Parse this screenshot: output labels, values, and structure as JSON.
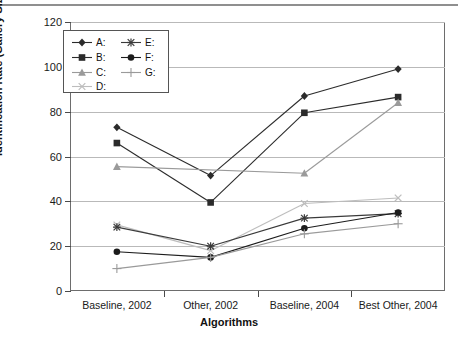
{
  "chart_data": {
    "type": "line",
    "title": "",
    "xlabel": "Algorithms",
    "ylabel": "Identification Rate (Gallery Size = 71)",
    "categories": [
      "Baseline, 2002",
      "Other, 2002",
      "Baseline, 2004",
      "Best Other, 2004"
    ],
    "ylim": [
      0,
      120
    ],
    "yticks": [
      0,
      20,
      40,
      60,
      80,
      100,
      120
    ],
    "grid": true,
    "legend_position": "upper-left-inside",
    "series": [
      {
        "name": "A:",
        "marker": "diamond",
        "color": "#2b2b2b",
        "values": [
          73,
          51.5,
          87,
          99
        ]
      },
      {
        "name": "B:",
        "marker": "square",
        "color": "#2b2b2b",
        "values": [
          66,
          39.5,
          79.5,
          86.5
        ]
      },
      {
        "name": "C:",
        "marker": "triangle",
        "color": "#9a9a9a",
        "values": [
          55.5,
          null,
          52.5,
          84
        ]
      },
      {
        "name": "D:",
        "marker": "x",
        "color": "#bdbdbd",
        "values": [
          29.5,
          18,
          39,
          41.5
        ]
      },
      {
        "name": "E:",
        "marker": "star",
        "color": "#3a3a3a",
        "values": [
          28.5,
          20,
          32.5,
          34.5
        ]
      },
      {
        "name": "F:",
        "marker": "circle",
        "color": "#1c1c1c",
        "values": [
          17.5,
          15,
          28,
          35
        ]
      },
      {
        "name": "G:",
        "marker": "plus",
        "color": "#9a9a9a",
        "values": [
          10,
          15,
          25.5,
          30
        ]
      }
    ]
  },
  "axis": {
    "y_tick_labels": [
      "120",
      "100",
      "80",
      "60",
      "40",
      "20",
      "0"
    ],
    "x_tick_labels": [
      "Baseline, 2002",
      "Other, 2002",
      "Baseline, 2004",
      "Best Other, 2004"
    ],
    "y_title": "Identification Rate (Gallery Size = 71)",
    "x_title": "Algorithms"
  },
  "legend": {
    "entries": [
      {
        "label": "A:",
        "col": 0,
        "row": 0
      },
      {
        "label": "B:",
        "col": 0,
        "row": 1
      },
      {
        "label": "C:",
        "col": 0,
        "row": 2
      },
      {
        "label": "D:",
        "col": 0,
        "row": 3
      },
      {
        "label": "E:",
        "col": 1,
        "row": 0
      },
      {
        "label": "F:",
        "col": 1,
        "row": 1
      },
      {
        "label": "G:",
        "col": 1,
        "row": 2
      }
    ]
  }
}
